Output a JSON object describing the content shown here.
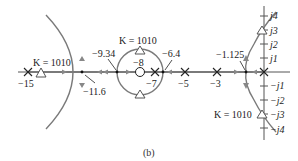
{
  "figure": {
    "caption": "(b)",
    "type": "root-locus",
    "colors": {
      "axis": "#555555",
      "locus": "#7a7a7a",
      "marker": "#333333",
      "text": "#222222"
    }
  },
  "real_axis": {
    "poles": [
      "-15",
      "-7",
      "-5",
      "-3",
      "0"
    ],
    "zeros": [
      "-8"
    ],
    "breakpoints": [
      "-11.6",
      "-9.34",
      "-6.4",
      "-1.125"
    ]
  },
  "imag_axis": {
    "ticks": [
      "j4",
      "j3",
      "j2",
      "j1",
      "−j1",
      "−j2",
      "−j3",
      "−j4"
    ]
  },
  "labels": {
    "pole_m15": "−15",
    "pole_m7": "−7",
    "pole_m5": "−5",
    "pole_m3": "−3",
    "zero_m8": "−8",
    "break_m11_6": "−11.6",
    "break_m9_34": "−9.34",
    "break_m6_4": "−6.4",
    "break_m1_125": "−1.125",
    "k_left": "K = 1010",
    "k_circle": "K = 1010",
    "k_right": "K = 1010",
    "j4": "j4",
    "j3": "j3",
    "j2": "j2",
    "j1": "j1",
    "mj1": "−j1",
    "mj2": "−j2",
    "mj3": "−j3",
    "mj4": "−j4"
  }
}
